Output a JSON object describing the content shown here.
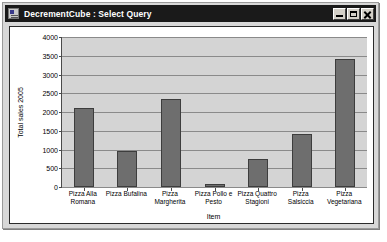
{
  "window": {
    "title": "DecrementCube : Select Query",
    "icon": "query-icon",
    "minimize_label": "Minimize",
    "maximize_label": "Maximize",
    "close_label": "Close"
  },
  "colors": {
    "titlebar": "#1a1a1a",
    "title_text": "#ffffff",
    "window_face": "#d8d8d8",
    "chart_background": "#ffffff",
    "plot_background": "#d4d4d4",
    "bar_fill": "#6e6e6e",
    "bar_border": "#3d3d3d",
    "gridline": "#8a8a8a",
    "axis": "#4a4a4a"
  },
  "chart_data": {
    "type": "bar",
    "title": "",
    "xlabel": "Item",
    "ylabel": "Total sales 2005",
    "ylim": [
      0,
      4000
    ],
    "ytick_step": 500,
    "yticks": [
      0,
      500,
      1000,
      1500,
      2000,
      2500,
      3000,
      3500,
      4000
    ],
    "grid": true,
    "legend": false,
    "categories": [
      "Pizza Alla Romana",
      "Pizza Bufalina",
      "Pizza Margherita",
      "Pizza Pollo e Pesto",
      "Pizza Quattro Stagioni",
      "Pizza Salsiccia",
      "Pizza Vegetariana"
    ],
    "values": [
      2100,
      960,
      2350,
      70,
      750,
      1420,
      3420
    ]
  }
}
